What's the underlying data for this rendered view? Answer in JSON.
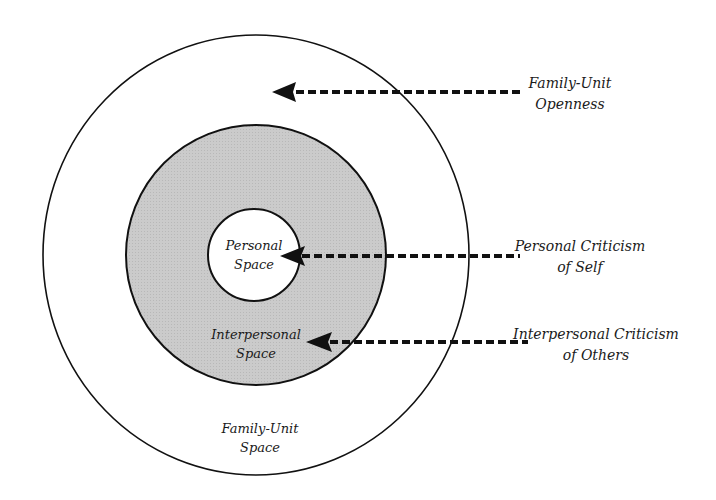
{
  "diagram": {
    "type": "concentric-circles",
    "colors": {
      "outline": "#111111",
      "middle_ring_fill": "#c9c9c9",
      "background": "#ffffff",
      "arrow": "#111111"
    },
    "regions": {
      "inner": {
        "line1": "Personal",
        "line2": "Space"
      },
      "middle": {
        "line1": "Interpersonal",
        "line2": "Space"
      },
      "outer": {
        "line1": "Family-Unit",
        "line2": "Space"
      }
    },
    "callouts": [
      {
        "line1": "Family-Unit",
        "line2": "Openness"
      },
      {
        "line1": "Personal Criticism",
        "line2": "of Self"
      },
      {
        "line1": "Interpersonal Criticism",
        "line2": "of Others"
      }
    ]
  }
}
